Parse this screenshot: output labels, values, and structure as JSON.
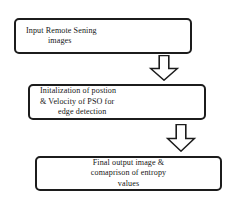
{
  "diagram": {
    "type": "flowchart",
    "orientation": "vertical",
    "colors": {
      "background": "#ffffff",
      "node_fill": "#ffffff",
      "stroke": "#1c1c1c",
      "text": "#161616"
    },
    "nodes": [
      {
        "id": "input",
        "shape": "rounded-rectangle",
        "lines": [
          "Input Remote Sening",
          "images"
        ]
      },
      {
        "id": "init",
        "shape": "rounded-rectangle",
        "lines": [
          "Initalization of postion",
          "& Velocity of PSO for",
          "edge detection"
        ]
      },
      {
        "id": "output",
        "shape": "rounded-rectangle",
        "lines": [
          "Final output image &",
          "comaprison of entropy",
          "values"
        ]
      }
    ],
    "connectors": [
      {
        "id": "arrow-1",
        "icon": "block-arrow-down-icon",
        "from": "input",
        "to": "init",
        "direction": "down"
      },
      {
        "id": "arrow-2",
        "icon": "block-arrow-down-icon",
        "from": "init",
        "to": "output",
        "direction": "down"
      }
    ]
  }
}
